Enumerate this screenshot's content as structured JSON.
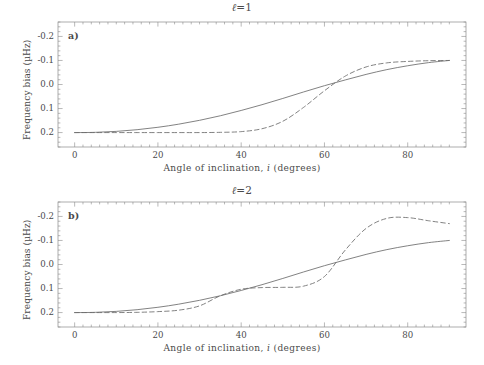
{
  "figure": {
    "background": "#ffffff",
    "line_color": "#6b6b6b",
    "axis_color": "#8a8a8a"
  },
  "panels": [
    {
      "id": "a",
      "letter": "a)",
      "title_prefix": "ℓ",
      "title_rest": "=1",
      "title": "ℓ=1",
      "xlabel_pre": "Angle of inclination, ",
      "xlabel_ital": "i",
      "xlabel_post": " (degrees)",
      "ylabel": "Frequency bias (µHz)",
      "xticks": [
        "0",
        "20",
        "40",
        "60",
        "80"
      ],
      "yticks": [
        "0.2",
        "0.1",
        "0.0",
        "-0.1",
        "-0.2"
      ]
    },
    {
      "id": "b",
      "letter": "b)",
      "title_prefix": "ℓ",
      "title_rest": "=2",
      "title": "ℓ=2",
      "xlabel_pre": "Angle of inclination, ",
      "xlabel_ital": "i",
      "xlabel_post": " (degrees)",
      "ylabel": "Frequency bias (µHz)",
      "xticks": [
        "0",
        "20",
        "40",
        "60",
        "80"
      ],
      "yticks": [
        "0.2",
        "0.1",
        "0.0",
        "-0.1",
        "-0.2"
      ]
    }
  ],
  "chart_data": [
    {
      "type": "line",
      "title": "ℓ=1",
      "xlabel": "Angle of inclination, i (degrees)",
      "ylabel": "Frequency bias (µHz)",
      "xlim": [
        -4,
        94
      ],
      "ylim": [
        -0.26,
        0.26
      ],
      "xticks": [
        0,
        20,
        40,
        60,
        80
      ],
      "yticks": [
        -0.2,
        -0.1,
        0.0,
        0.1,
        0.2
      ],
      "grid": false,
      "legend": "none",
      "x": [
        0,
        5,
        10,
        15,
        20,
        25,
        30,
        35,
        40,
        45,
        50,
        55,
        60,
        65,
        70,
        75,
        80,
        85,
        90
      ],
      "series": [
        {
          "name": "solid",
          "style": "solid",
          "values": [
            -0.2,
            -0.199,
            -0.195,
            -0.188,
            -0.178,
            -0.165,
            -0.149,
            -0.13,
            -0.108,
            -0.084,
            -0.058,
            -0.031,
            -0.005,
            0.019,
            0.042,
            0.062,
            0.078,
            0.091,
            0.1
          ]
        },
        {
          "name": "dashed",
          "style": "dashed",
          "values": [
            -0.2,
            -0.2,
            -0.2,
            -0.2,
            -0.2,
            -0.2,
            -0.2,
            -0.199,
            -0.196,
            -0.184,
            -0.153,
            -0.095,
            -0.026,
            0.035,
            0.073,
            0.09,
            0.096,
            0.099,
            0.1
          ]
        }
      ]
    },
    {
      "type": "line",
      "title": "ℓ=2",
      "xlabel": "Angle of inclination, i (degrees)",
      "ylabel": "Frequency bias (µHz)",
      "xlim": [
        -4,
        94
      ],
      "ylim": [
        -0.26,
        0.26
      ],
      "xticks": [
        0,
        20,
        40,
        60,
        80
      ],
      "yticks": [
        -0.2,
        -0.1,
        0.0,
        0.1,
        0.2
      ],
      "grid": false,
      "legend": "none",
      "x": [
        0,
        5,
        10,
        15,
        20,
        25,
        30,
        35,
        40,
        45,
        50,
        55,
        60,
        65,
        70,
        75,
        80,
        85,
        90
      ],
      "series": [
        {
          "name": "solid",
          "style": "solid",
          "values": [
            -0.2,
            -0.199,
            -0.195,
            -0.188,
            -0.178,
            -0.165,
            -0.149,
            -0.13,
            -0.108,
            -0.084,
            -0.058,
            -0.031,
            -0.005,
            0.019,
            0.042,
            0.062,
            0.078,
            0.091,
            0.1
          ]
        },
        {
          "name": "dashed",
          "style": "dashed",
          "values": [
            -0.2,
            -0.2,
            -0.2,
            -0.199,
            -0.196,
            -0.19,
            -0.172,
            -0.13,
            -0.103,
            -0.096,
            -0.095,
            -0.09,
            -0.05,
            0.06,
            0.15,
            0.192,
            0.195,
            0.182,
            0.17
          ]
        }
      ]
    }
  ]
}
